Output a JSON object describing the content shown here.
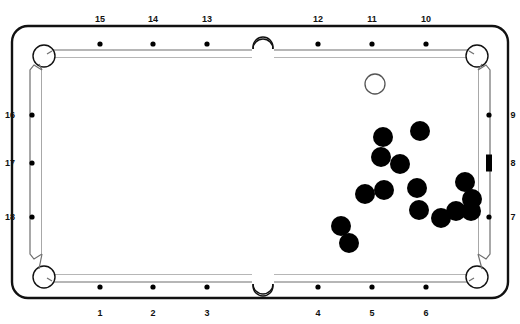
{
  "diagram": {
    "type": "pool-table-diagram",
    "canvas": {
      "width": 520,
      "height": 324
    },
    "colors": {
      "outline": "#111111",
      "rail_inner": "#6f6f6f",
      "cloth": "#ffffff",
      "object_ball": "#000000",
      "cue_ball_fill": "#ffffff",
      "cue_ball_stroke": "#555555",
      "diamond": "#000000",
      "label": "#111111",
      "background": "#ffffff"
    },
    "table": {
      "outer": {
        "x": 12,
        "y": 26,
        "width": 496,
        "height": 272,
        "radius": 16
      },
      "cushion": {
        "x": 30,
        "y": 44,
        "width": 460,
        "height": 236
      },
      "playfield": {
        "x": 38,
        "y": 52,
        "width": 444,
        "height": 220
      }
    }
  },
  "labels": {
    "top": [
      {
        "text": "15",
        "x": 100,
        "y": 14
      },
      {
        "text": "14",
        "x": 153,
        "y": 14
      },
      {
        "text": "13",
        "x": 207,
        "y": 14
      },
      {
        "text": "12",
        "x": 318,
        "y": 14
      },
      {
        "text": "11",
        "x": 372,
        "y": 14
      },
      {
        "text": "10",
        "x": 426,
        "y": 14
      }
    ],
    "bottom": [
      {
        "text": "1",
        "x": 100,
        "y": 308
      },
      {
        "text": "2",
        "x": 153,
        "y": 308
      },
      {
        "text": "3",
        "x": 207,
        "y": 308
      },
      {
        "text": "4",
        "x": 318,
        "y": 308
      },
      {
        "text": "5",
        "x": 372,
        "y": 308
      },
      {
        "text": "6",
        "x": 426,
        "y": 308
      }
    ],
    "left": [
      {
        "text": "16",
        "x": 3,
        "y": 115
      },
      {
        "text": "17",
        "x": 3,
        "y": 163
      },
      {
        "text": "18",
        "x": 3,
        "y": 217
      }
    ],
    "right": [
      {
        "text": "9",
        "x": 506,
        "y": 115
      },
      {
        "text": "8",
        "x": 506,
        "y": 163
      },
      {
        "text": "7",
        "x": 506,
        "y": 217
      }
    ]
  },
  "diamonds": {
    "top": [
      {
        "cx": 100,
        "cy": 44,
        "r": 2.6
      },
      {
        "cx": 153,
        "cy": 44,
        "r": 2.6
      },
      {
        "cx": 207,
        "cy": 44,
        "r": 2.6
      },
      {
        "cx": 318,
        "cy": 44,
        "r": 2.6
      },
      {
        "cx": 372,
        "cy": 44,
        "r": 2.6
      },
      {
        "cx": 426,
        "cy": 44,
        "r": 2.6
      }
    ],
    "bottom": [
      {
        "cx": 100,
        "cy": 287,
        "r": 2.6
      },
      {
        "cx": 153,
        "cy": 287,
        "r": 2.6
      },
      {
        "cx": 207,
        "cy": 287,
        "r": 2.6
      },
      {
        "cx": 318,
        "cy": 287,
        "r": 2.6
      },
      {
        "cx": 372,
        "cy": 287,
        "r": 2.6
      },
      {
        "cx": 426,
        "cy": 287,
        "r": 2.6
      }
    ],
    "left": [
      {
        "cx": 32,
        "cy": 115,
        "r": 2.6
      },
      {
        "cx": 32,
        "cy": 163,
        "r": 2.6
      },
      {
        "cx": 32,
        "cy": 217,
        "r": 2.6
      }
    ],
    "right": [
      {
        "cx": 489,
        "cy": 115,
        "r": 2.6,
        "shape": "dot"
      },
      {
        "cx": 489,
        "cy": 163,
        "shape": "bar",
        "width": 6,
        "height": 17
      },
      {
        "cx": 489,
        "cy": 217,
        "r": 2.6,
        "shape": "dot"
      }
    ]
  },
  "pockets": [
    {
      "name": "top-left-pocket",
      "cx": 44,
      "cy": 56,
      "r": 11
    },
    {
      "name": "top-side-pocket",
      "cx": 263,
      "cy": 45,
      "r": 10
    },
    {
      "name": "top-right-pocket",
      "cx": 477,
      "cy": 56,
      "r": 11
    },
    {
      "name": "bottom-left-pocket",
      "cx": 44,
      "cy": 277,
      "r": 11
    },
    {
      "name": "bottom-side-pocket",
      "cx": 263,
      "cy": 287,
      "r": 10
    },
    {
      "name": "bottom-right-pocket",
      "cx": 477,
      "cy": 277,
      "r": 11
    }
  ],
  "balls": {
    "cue": {
      "label": "cue-ball",
      "cx": 375,
      "cy": 84,
      "r": 10
    },
    "objects": [
      {
        "label": "object-ball-1",
        "cx": 383,
        "cy": 137,
        "r": 10
      },
      {
        "label": "object-ball-2",
        "cx": 420,
        "cy": 131,
        "r": 10
      },
      {
        "label": "object-ball-3",
        "cx": 381,
        "cy": 157,
        "r": 10
      },
      {
        "label": "object-ball-4",
        "cx": 400,
        "cy": 164,
        "r": 10
      },
      {
        "label": "object-ball-5",
        "cx": 365,
        "cy": 194,
        "r": 10
      },
      {
        "label": "object-ball-6",
        "cx": 384,
        "cy": 190,
        "r": 10
      },
      {
        "label": "object-ball-7",
        "cx": 417,
        "cy": 188,
        "r": 10
      },
      {
        "label": "object-ball-8",
        "cx": 465,
        "cy": 182,
        "r": 10
      },
      {
        "label": "object-ball-9",
        "cx": 472,
        "cy": 199,
        "r": 10
      },
      {
        "label": "object-ball-10",
        "cx": 419,
        "cy": 210,
        "r": 10
      },
      {
        "label": "object-ball-11",
        "cx": 441,
        "cy": 218,
        "r": 10
      },
      {
        "label": "object-ball-12",
        "cx": 456,
        "cy": 211,
        "r": 10
      },
      {
        "label": "object-ball-13",
        "cx": 471,
        "cy": 211,
        "r": 10
      },
      {
        "label": "object-ball-14",
        "cx": 341,
        "cy": 226,
        "r": 10
      },
      {
        "label": "object-ball-15",
        "cx": 349,
        "cy": 243,
        "r": 10
      }
    ]
  }
}
